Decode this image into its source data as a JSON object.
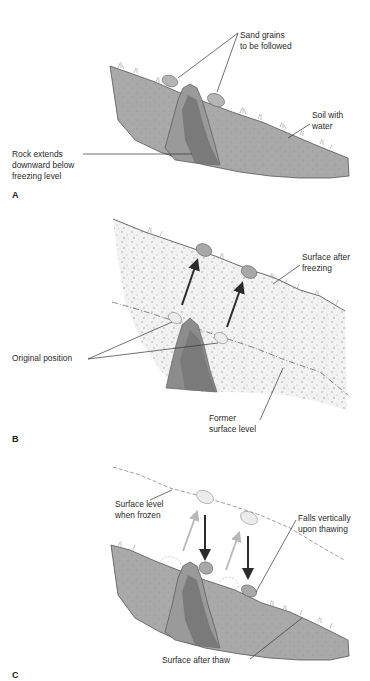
{
  "panels": [
    {
      "id": "A",
      "label": "A",
      "callouts": {
        "sand_grains": [
          "Sand grains",
          "to be followed"
        ],
        "soil": [
          "Soil with",
          "water"
        ],
        "rock": [
          "Rock extends",
          "downward below",
          "freezing level"
        ]
      }
    },
    {
      "id": "B",
      "label": "B",
      "callouts": {
        "surface_after_freezing": [
          "Surface after",
          "freezing"
        ],
        "original_position": [
          "Original position"
        ],
        "former_surface": [
          "Former",
          "surface level"
        ]
      }
    },
    {
      "id": "C",
      "label": "C",
      "callouts": {
        "surface_when_frozen": [
          "Surface level",
          "when frozen"
        ],
        "falls_vertically": [
          "Falls vertically",
          "upon thawing"
        ],
        "surface_after_thaw": [
          "Surface after thaw"
        ]
      }
    }
  ],
  "colors": {
    "soil": "#a9a9a9",
    "soil_dark_edge": "#555555",
    "frozen_soil": "#f1f1f1",
    "rock_light": "#9a9a9a",
    "rock_dark": "#7a7a7a",
    "grain": "#b5b5b5",
    "grain_pale": "#ececec",
    "arrow_dark": "#2b2b2b",
    "arrow_light": "#b8b8b8"
  }
}
